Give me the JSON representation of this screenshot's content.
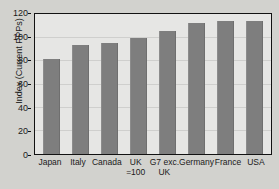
{
  "chart_data": {
    "type": "bar",
    "title": "",
    "xlabel": "",
    "ylabel": "Index (Current PPPs)",
    "ylim": [
      0,
      120
    ],
    "yticks": [
      0,
      20,
      40,
      60,
      80,
      100,
      120
    ],
    "ytick_labels": [
      "0",
      "20",
      "40",
      "60",
      "80",
      "100",
      "120"
    ],
    "grid": true,
    "legend": "none",
    "bar_color": "#7e7e7e",
    "plot_background": "#e6e6e4",
    "figure_background": "#d2d2ce",
    "axis_color": "#121212",
    "categories": [
      "Japan",
      "Italy",
      "Canada",
      "UK =100",
      "G7 exc. UK",
      "Germany",
      "France",
      "USA"
    ],
    "category_labels": [
      {
        "line1": "Japan",
        "line2": ""
      },
      {
        "line1": "Italy",
        "line2": ""
      },
      {
        "line1": "Canada",
        "line2": ""
      },
      {
        "line1": "UK",
        "line2": "=100"
      },
      {
        "line1": "G7 exc.",
        "line2": "UK"
      },
      {
        "line1": "Germany",
        "line2": ""
      },
      {
        "line1": "France",
        "line2": ""
      },
      {
        "line1": "USA",
        "line2": ""
      }
    ],
    "values": [
      82,
      94,
      95.5,
      100,
      106,
      113.5,
      114.5,
      114.5
    ]
  }
}
